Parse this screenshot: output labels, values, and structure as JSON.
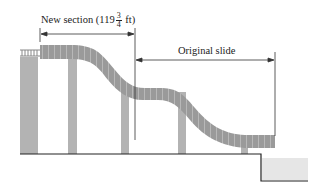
{
  "diagram": {
    "labels": {
      "new_section_prefix": "New section (119",
      "new_section_frac_num": "3",
      "new_section_frac_den": "4",
      "new_section_suffix": " ft)",
      "original_slide": "Original slide"
    },
    "colors": {
      "slide_fill": "#9a9a9a",
      "slide_stripe": "#d0d0d0",
      "pillar_fill": "#b3b3b3",
      "ground_line": "#222222",
      "pool_fill": "#e6e6e6",
      "dimension_line": "#333333"
    }
  }
}
